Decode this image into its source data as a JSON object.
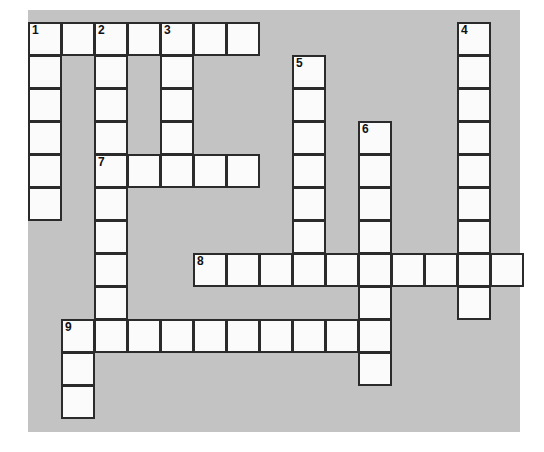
{
  "puzzle": {
    "title": "Crossword Puzzle Grid",
    "colors": {
      "page_background": "#ffffff",
      "board_background": "#c3c3c3",
      "cell_fill": "#fbfbfb",
      "cell_border": "#2b2b2b",
      "number_color": "#111111"
    },
    "geometry": {
      "cell_size": 33,
      "grid_origin_x": 0,
      "grid_origin_y": 12,
      "columns": 15,
      "rows": 12
    },
    "cells": [
      {
        "r": 0,
        "c": 0,
        "number": "1",
        "letter": ""
      },
      {
        "r": 0,
        "c": 1,
        "number": "",
        "letter": ""
      },
      {
        "r": 0,
        "c": 2,
        "number": "2",
        "letter": ""
      },
      {
        "r": 0,
        "c": 3,
        "number": "",
        "letter": ""
      },
      {
        "r": 0,
        "c": 4,
        "number": "3",
        "letter": ""
      },
      {
        "r": 0,
        "c": 5,
        "number": "",
        "letter": ""
      },
      {
        "r": 0,
        "c": 6,
        "number": "",
        "letter": ""
      },
      {
        "r": 0,
        "c": 13,
        "number": "4",
        "letter": ""
      },
      {
        "r": 1,
        "c": 0,
        "number": "",
        "letter": ""
      },
      {
        "r": 1,
        "c": 2,
        "number": "",
        "letter": ""
      },
      {
        "r": 1,
        "c": 4,
        "number": "",
        "letter": ""
      },
      {
        "r": 1,
        "c": 8,
        "number": "5",
        "letter": ""
      },
      {
        "r": 1,
        "c": 13,
        "number": "",
        "letter": ""
      },
      {
        "r": 2,
        "c": 0,
        "number": "",
        "letter": ""
      },
      {
        "r": 2,
        "c": 2,
        "number": "",
        "letter": ""
      },
      {
        "r": 2,
        "c": 4,
        "number": "",
        "letter": ""
      },
      {
        "r": 2,
        "c": 8,
        "number": "",
        "letter": ""
      },
      {
        "r": 2,
        "c": 13,
        "number": "",
        "letter": ""
      },
      {
        "r": 3,
        "c": 0,
        "number": "",
        "letter": ""
      },
      {
        "r": 3,
        "c": 2,
        "number": "",
        "letter": ""
      },
      {
        "r": 3,
        "c": 4,
        "number": "",
        "letter": ""
      },
      {
        "r": 3,
        "c": 8,
        "number": "",
        "letter": ""
      },
      {
        "r": 3,
        "c": 10,
        "number": "6",
        "letter": ""
      },
      {
        "r": 3,
        "c": 13,
        "number": "",
        "letter": ""
      },
      {
        "r": 4,
        "c": 0,
        "number": "",
        "letter": ""
      },
      {
        "r": 4,
        "c": 2,
        "number": "7",
        "letter": ""
      },
      {
        "r": 4,
        "c": 3,
        "number": "",
        "letter": ""
      },
      {
        "r": 4,
        "c": 4,
        "number": "",
        "letter": ""
      },
      {
        "r": 4,
        "c": 5,
        "number": "",
        "letter": ""
      },
      {
        "r": 4,
        "c": 6,
        "number": "",
        "letter": ""
      },
      {
        "r": 4,
        "c": 8,
        "number": "",
        "letter": ""
      },
      {
        "r": 4,
        "c": 10,
        "number": "",
        "letter": ""
      },
      {
        "r": 4,
        "c": 13,
        "number": "",
        "letter": ""
      },
      {
        "r": 5,
        "c": 0,
        "number": "",
        "letter": ""
      },
      {
        "r": 5,
        "c": 2,
        "number": "",
        "letter": ""
      },
      {
        "r": 5,
        "c": 8,
        "number": "",
        "letter": ""
      },
      {
        "r": 5,
        "c": 10,
        "number": "",
        "letter": ""
      },
      {
        "r": 5,
        "c": 13,
        "number": "",
        "letter": ""
      },
      {
        "r": 6,
        "c": 2,
        "number": "",
        "letter": ""
      },
      {
        "r": 6,
        "c": 8,
        "number": "",
        "letter": ""
      },
      {
        "r": 6,
        "c": 10,
        "number": "",
        "letter": ""
      },
      {
        "r": 6,
        "c": 13,
        "number": "",
        "letter": ""
      },
      {
        "r": 7,
        "c": 2,
        "number": "",
        "letter": ""
      },
      {
        "r": 7,
        "c": 5,
        "number": "8",
        "letter": ""
      },
      {
        "r": 7,
        "c": 6,
        "number": "",
        "letter": ""
      },
      {
        "r": 7,
        "c": 7,
        "number": "",
        "letter": ""
      },
      {
        "r": 7,
        "c": 8,
        "number": "",
        "letter": ""
      },
      {
        "r": 7,
        "c": 9,
        "number": "",
        "letter": ""
      },
      {
        "r": 7,
        "c": 10,
        "number": "",
        "letter": ""
      },
      {
        "r": 7,
        "c": 11,
        "number": "",
        "letter": ""
      },
      {
        "r": 7,
        "c": 12,
        "number": "",
        "letter": ""
      },
      {
        "r": 7,
        "c": 13,
        "number": "",
        "letter": ""
      },
      {
        "r": 7,
        "c": 14,
        "number": "",
        "letter": ""
      },
      {
        "r": 8,
        "c": 2,
        "number": "",
        "letter": ""
      },
      {
        "r": 8,
        "c": 10,
        "number": "",
        "letter": ""
      },
      {
        "r": 8,
        "c": 13,
        "number": "",
        "letter": ""
      },
      {
        "r": 9,
        "c": 1,
        "number": "9",
        "letter": ""
      },
      {
        "r": 9,
        "c": 2,
        "number": "",
        "letter": ""
      },
      {
        "r": 9,
        "c": 3,
        "number": "",
        "letter": ""
      },
      {
        "r": 9,
        "c": 4,
        "number": "",
        "letter": ""
      },
      {
        "r": 9,
        "c": 5,
        "number": "",
        "letter": ""
      },
      {
        "r": 9,
        "c": 6,
        "number": "",
        "letter": ""
      },
      {
        "r": 9,
        "c": 7,
        "number": "",
        "letter": ""
      },
      {
        "r": 9,
        "c": 8,
        "number": "",
        "letter": ""
      },
      {
        "r": 9,
        "c": 9,
        "number": "",
        "letter": ""
      },
      {
        "r": 9,
        "c": 10,
        "number": "",
        "letter": ""
      },
      {
        "r": 10,
        "c": 1,
        "number": "",
        "letter": ""
      },
      {
        "r": 10,
        "c": 10,
        "number": "",
        "letter": ""
      },
      {
        "r": 11,
        "c": 1,
        "number": "",
        "letter": ""
      }
    ],
    "entries": {
      "across": [
        {
          "number": "1",
          "row": 0,
          "col": 0,
          "length": 7
        },
        {
          "number": "7",
          "row": 4,
          "col": 2,
          "length": 5
        },
        {
          "number": "8",
          "row": 7,
          "col": 5,
          "length": 10
        },
        {
          "number": "9",
          "row": 9,
          "col": 1,
          "length": 10
        }
      ],
      "down": [
        {
          "number": "1",
          "row": 0,
          "col": 0,
          "length": 6
        },
        {
          "number": "2",
          "row": 0,
          "col": 2,
          "length": 10
        },
        {
          "number": "3",
          "row": 0,
          "col": 4,
          "length": 5
        },
        {
          "number": "4",
          "row": 0,
          "col": 13,
          "length": 9
        },
        {
          "number": "5",
          "row": 1,
          "col": 8,
          "length": 7
        },
        {
          "number": "6",
          "row": 3,
          "col": 10,
          "length": 9
        },
        {
          "number": "9",
          "row": 9,
          "col": 1,
          "length": 3
        }
      ]
    }
  }
}
